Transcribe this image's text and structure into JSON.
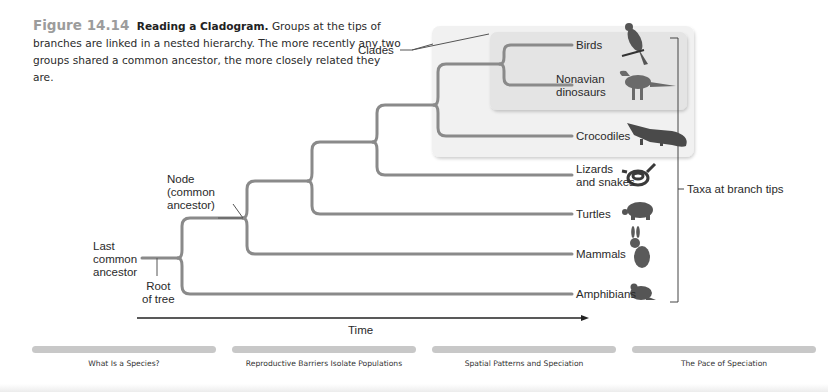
{
  "figure": {
    "number": "Figure 14.14",
    "title": "Reading a Cladogram.",
    "caption": "Groups at the tips of branches are linked in a nested hierarchy. The more recently any two groups shared a common ancestor, the more closely related they are."
  },
  "annotations": {
    "clades": "Clades",
    "node_line1": "Node",
    "node_line2": "(common",
    "node_line3": "ancestor)",
    "lca_line1": "Last",
    "lca_line2": "common",
    "lca_line3": "ancestor",
    "root_line1": "Root",
    "root_line2": "of tree",
    "taxa": "Taxa at branch tips",
    "time": "Time"
  },
  "taxa": [
    {
      "line1": "Birds",
      "line2": "",
      "icon": "bird-icon"
    },
    {
      "line1": "Nonavian",
      "line2": "dinosaurs",
      "icon": "dinosaur-icon"
    },
    {
      "line1": "Crocodiles",
      "line2": "",
      "icon": "crocodile-icon"
    },
    {
      "line1": "Lizards",
      "line2": "and snakes",
      "icon": "snake-icon"
    },
    {
      "line1": "Turtles",
      "line2": "",
      "icon": "turtle-icon"
    },
    {
      "line1": "Mammals",
      "line2": "",
      "icon": "rabbit-icon"
    },
    {
      "line1": "Amphibians",
      "line2": "",
      "icon": "frog-icon"
    }
  ],
  "nav": [
    {
      "label": "What Is a Species?"
    },
    {
      "label": "Reproductive Barriers Isolate Populations"
    },
    {
      "label": "Spatial Patterns and Speciation"
    },
    {
      "label": "The Pace of Speciation"
    }
  ],
  "colors": {
    "branch": "#8a8a8a",
    "clade_outer": "#f1f1f1",
    "clade_inner": "#e4e4e4",
    "figure_number": "#9c9c9c",
    "nav_bar": "#c8c8c8"
  }
}
